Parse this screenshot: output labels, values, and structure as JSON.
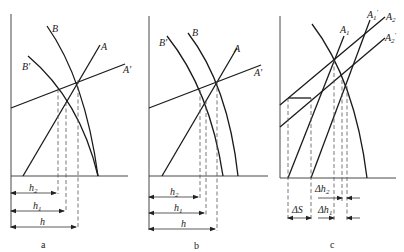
{
  "figure": {
    "panels": [
      {
        "id": "a",
        "caption": "a",
        "curve_labels": {
          "B": "B",
          "B_prime": "B'",
          "A": "A",
          "A_prime": "A'"
        },
        "dimensions": {
          "h2": "h2",
          "h1": "h1",
          "h": "h"
        }
      },
      {
        "id": "b",
        "caption": "b",
        "curve_labels": {
          "B": "B",
          "B_prime": "B'",
          "A": "A",
          "A_prime": "A'"
        },
        "dimensions": {
          "h2": "h2",
          "h1": "h1",
          "h": "h"
        }
      },
      {
        "id": "c",
        "caption": "c",
        "curve_labels": {
          "A1": "A1",
          "A1_prime": "A1'",
          "A2": "A2",
          "A2_prime": "A2'"
        },
        "dimensions": {
          "dS": "ΔS",
          "dh2": "Δh2",
          "dh1": "Δh1"
        }
      }
    ]
  }
}
